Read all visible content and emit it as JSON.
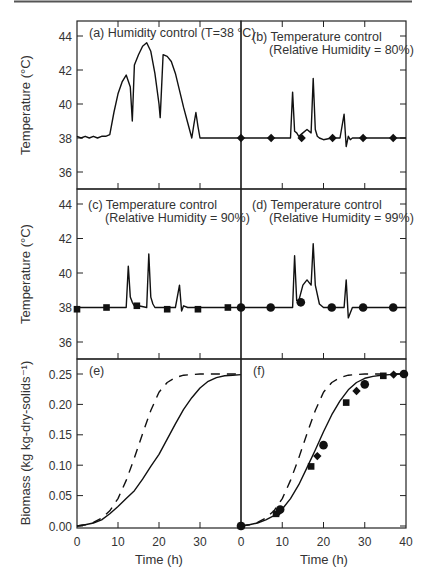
{
  "chart_data": [
    {
      "panel": "a",
      "type": "line",
      "title": "(a) Humidity control (T=38 °C)",
      "xlabel": "",
      "ylabel": "Temperature (°C)",
      "xlim": [
        0,
        40
      ],
      "ylim": [
        35,
        45
      ],
      "yticks": [
        36,
        38,
        40,
        42,
        44
      ],
      "series": [
        {
          "name": "Temperature",
          "style": "solid",
          "x": [
            0,
            1,
            2,
            3,
            4,
            5,
            6,
            7,
            8,
            9,
            10,
            11,
            12,
            13,
            13.5,
            14,
            15,
            16,
            17,
            18,
            19,
            20,
            20.3,
            21,
            22,
            23,
            24,
            25,
            26,
            27,
            28,
            28.5,
            29,
            29.5,
            30,
            31,
            32,
            33,
            34,
            35,
            36,
            37,
            38,
            39,
            40
          ],
          "y": [
            38.1,
            38.0,
            38.1,
            38.0,
            38.1,
            38.0,
            38.1,
            38.1,
            38.2,
            39.5,
            40.6,
            41.3,
            41.7,
            41.0,
            39.0,
            42.3,
            42.9,
            43.4,
            43.6,
            43.1,
            41.8,
            40.0,
            39.2,
            42.9,
            42.8,
            42.5,
            41.8,
            40.8,
            39.8,
            38.9,
            38.0,
            38.8,
            39.5,
            38.7,
            38.0,
            38.0,
            38.0,
            38.0,
            38.0,
            38.0,
            38.0,
            38.0,
            38.0,
            38.0,
            38.0
          ]
        }
      ]
    },
    {
      "panel": "b",
      "type": "line",
      "title": "(b) Temperature control (Relative Humidity = 80%)",
      "xlim": [
        0,
        40
      ],
      "ylim": [
        35,
        45
      ],
      "yticks": [
        36,
        38,
        40,
        42,
        44
      ],
      "series": [
        {
          "name": "Temperature",
          "style": "solid",
          "marker": "diamond",
          "x": [
            0,
            12,
            12.5,
            13,
            13.5,
            14,
            15,
            16,
            17,
            17.5,
            18,
            18.5,
            19,
            20,
            22,
            24,
            25,
            25.5,
            26,
            26.5,
            27,
            30,
            35,
            40
          ],
          "y": [
            38.0,
            38.0,
            40.7,
            38.4,
            38.3,
            38.1,
            38.3,
            38.5,
            38.3,
            41.5,
            38.5,
            38.1,
            38.0,
            37.9,
            38.0,
            38.0,
            39.4,
            37.5,
            38.1,
            37.9,
            38.0,
            38.0,
            38.0,
            38.0
          ],
          "marker_x": [
            0,
            7.3,
            14.7,
            22.2,
            29.6,
            36.9
          ],
          "marker_y": [
            38.0,
            38.0,
            38.0,
            38.0,
            38.0,
            38.0
          ]
        }
      ]
    },
    {
      "panel": "c",
      "type": "line",
      "title": "(c) Temperature control (Relative Humidity = 90%)",
      "xlabel": "",
      "ylabel": "Temperature (°C)",
      "xlim": [
        0,
        40
      ],
      "ylim": [
        35,
        45
      ],
      "yticks": [
        36,
        38,
        40,
        42,
        44
      ],
      "series": [
        {
          "name": "Temperature",
          "style": "solid",
          "marker": "square",
          "x": [
            0,
            12,
            12.5,
            13,
            13.5,
            14,
            15,
            17,
            17.5,
            18,
            18.5,
            19,
            20,
            22,
            24,
            25,
            25.5,
            26,
            27,
            30,
            35,
            40
          ],
          "y": [
            38.0,
            38.0,
            40.4,
            38.6,
            38.3,
            38.1,
            38.1,
            38.0,
            41.1,
            38.6,
            38.2,
            38.0,
            38.0,
            38.0,
            38.0,
            39.3,
            37.8,
            38.1,
            38.0,
            38.0,
            38.0,
            38.0
          ],
          "marker_x": [
            0,
            7.2,
            14.6,
            22.0,
            29.5,
            36.8
          ],
          "marker_y": [
            37.9,
            38.0,
            38.1,
            37.9,
            37.9,
            38.0
          ]
        }
      ]
    },
    {
      "panel": "d",
      "type": "line",
      "title": "(d) Temperature control (Relative Humidity = 99%)",
      "xlim": [
        0,
        40
      ],
      "ylim": [
        35,
        45
      ],
      "yticks": [
        36,
        38,
        40,
        42,
        44
      ],
      "series": [
        {
          "name": "Temperature",
          "style": "solid",
          "marker": "circle",
          "x": [
            0,
            12.5,
            13,
            13.5,
            14,
            15,
            16,
            17,
            17.5,
            18,
            19,
            20,
            22,
            25,
            25.5,
            26,
            27,
            30,
            35,
            40
          ],
          "y": [
            38.0,
            38.0,
            41.0,
            38.4,
            38.4,
            39.3,
            39.6,
            39.3,
            41.7,
            39.3,
            38.2,
            38.0,
            38.0,
            38.0,
            39.6,
            37.4,
            38.0,
            38.0,
            38.0,
            38.0
          ],
          "marker_x": [
            0,
            7.2,
            14.5,
            22.0,
            29.6,
            36.9
          ],
          "marker_y": [
            38.0,
            38.0,
            38.3,
            38.0,
            38.0,
            38.0
          ]
        }
      ]
    },
    {
      "panel": "e",
      "type": "line",
      "title": "(e)",
      "xlabel": "Time (h)",
      "ylabel": "Biomass (kg kg-dry-solids⁻¹)",
      "xlim": [
        0,
        40
      ],
      "ylim": [
        0,
        0.25
      ],
      "xticks": [
        0,
        10,
        20,
        30
      ],
      "yticks": [
        0.0,
        0.05,
        0.1,
        0.15,
        0.2,
        0.25
      ],
      "yticklabels": [
        "0.00",
        "0.05",
        "0.10",
        "0.15",
        "0.20",
        "0.25"
      ],
      "series": [
        {
          "name": "Humidity control",
          "style": "solid",
          "x": [
            0,
            2,
            4,
            6,
            8,
            10,
            12,
            14,
            16,
            18,
            20,
            22,
            24,
            26,
            28,
            30,
            32,
            34,
            36,
            38,
            40
          ],
          "y": [
            0.0,
            0.002,
            0.005,
            0.01,
            0.02,
            0.032,
            0.045,
            0.058,
            0.077,
            0.098,
            0.118,
            0.143,
            0.168,
            0.192,
            0.211,
            0.227,
            0.238,
            0.244,
            0.247,
            0.248,
            0.249
          ]
        },
        {
          "name": "Reference (dashed)",
          "style": "dashed",
          "x": [
            0,
            2,
            4,
            6,
            8,
            10,
            12,
            14,
            16,
            18,
            20,
            22,
            24,
            26,
            28,
            30,
            32,
            34,
            36,
            38,
            40
          ],
          "y": [
            0.0,
            0.002,
            0.006,
            0.013,
            0.025,
            0.045,
            0.075,
            0.112,
            0.152,
            0.19,
            0.22,
            0.236,
            0.244,
            0.248,
            0.249,
            0.25,
            0.25,
            0.25,
            0.25,
            0.25,
            0.25
          ]
        }
      ]
    },
    {
      "panel": "f",
      "type": "line",
      "title": "(f)",
      "xlabel": "Time (h)",
      "xlim": [
        0,
        40
      ],
      "ylim": [
        0,
        0.25
      ],
      "xticks": [
        0,
        10,
        20,
        30,
        40
      ],
      "yticks": [
        0.0,
        0.05,
        0.1,
        0.15,
        0.2,
        0.25
      ],
      "series": [
        {
          "name": "Temperature control model",
          "style": "solid",
          "x": [
            0,
            2,
            4,
            6,
            8,
            10,
            12,
            14,
            16,
            18,
            20,
            22,
            24,
            26,
            28,
            30,
            32,
            34,
            36,
            38,
            40
          ],
          "y": [
            0.0,
            0.002,
            0.005,
            0.01,
            0.017,
            0.028,
            0.045,
            0.068,
            0.096,
            0.125,
            0.155,
            0.183,
            0.206,
            0.224,
            0.236,
            0.243,
            0.246,
            0.248,
            0.249,
            0.25,
            0.25
          ]
        },
        {
          "name": "Reference (dashed)",
          "style": "dashed",
          "x": [
            0,
            2,
            4,
            6,
            8,
            10,
            12,
            14,
            16,
            18,
            20,
            22,
            24,
            26,
            28,
            30,
            32,
            34,
            36,
            38,
            40
          ],
          "y": [
            0.0,
            0.002,
            0.006,
            0.013,
            0.025,
            0.045,
            0.075,
            0.112,
            0.152,
            0.19,
            0.22,
            0.236,
            0.244,
            0.248,
            0.249,
            0.25,
            0.25,
            0.25,
            0.25,
            0.25,
            0.25
          ]
        },
        {
          "name": "RH 80% (diamonds)",
          "style": "marker",
          "marker": "diamond",
          "x": [
            0,
            9,
            18.5,
            28,
            37
          ],
          "y": [
            0.0,
            0.022,
            0.115,
            0.222,
            0.249
          ]
        },
        {
          "name": "RH 90% (squares)",
          "style": "marker",
          "marker": "square",
          "x": [
            0,
            8.5,
            17,
            25.5,
            34.5
          ],
          "y": [
            0.0,
            0.02,
            0.098,
            0.203,
            0.247
          ]
        },
        {
          "name": "RH 99% (circles)",
          "style": "marker",
          "marker": "circle",
          "x": [
            0,
            9.5,
            20,
            30,
            39.5
          ],
          "y": [
            0.0,
            0.027,
            0.133,
            0.233,
            0.25
          ]
        }
      ]
    }
  ],
  "labels": {
    "ylabel_temp": "Temperature (°C)",
    "ylabel_bio": "Biomass (kg kg-dry-solids⁻¹)",
    "xlabel": "Time (h)"
  }
}
